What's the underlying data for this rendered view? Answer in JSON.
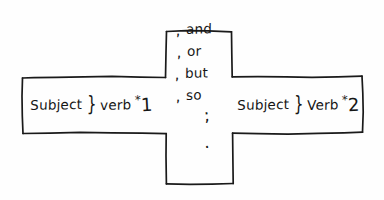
{
  "diagram": {
    "shape": "cross",
    "ink_color": "#161616",
    "background_color": "#ffffff",
    "left_clause": {
      "subject_label": "Subject",
      "separator": "}",
      "verb_label": "verb",
      "star_mark": "*",
      "number_mark": "1"
    },
    "right_clause": {
      "subject_label": "Subject",
      "separator": "}",
      "verb_label": "Verb",
      "star_mark": "*",
      "number_mark": "2"
    },
    "connectors": [
      {
        "comma": ",",
        "word": "and"
      },
      {
        "comma": ",",
        "word": "or"
      },
      {
        "comma": ",",
        "word": "but"
      },
      {
        "comma": ",",
        "word": "so"
      }
    ],
    "punctuation": [
      {
        "mark": ";"
      },
      {
        "mark": "."
      }
    ]
  }
}
